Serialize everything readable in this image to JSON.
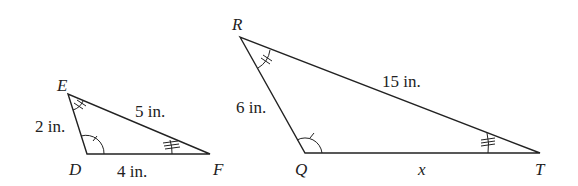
{
  "triangles": [
    {
      "name": "DEF",
      "vertices": {
        "E": "E",
        "D": "D",
        "F": "F"
      },
      "sides": {
        "ED": "2 in.",
        "EF": "5 in.",
        "DF": "4 in."
      }
    },
    {
      "name": "QRT",
      "vertices": {
        "R": "R",
        "Q": "Q",
        "T": "T"
      },
      "sides": {
        "RQ": "6 in.",
        "RT": "15 in.",
        "QT": "x"
      }
    }
  ]
}
